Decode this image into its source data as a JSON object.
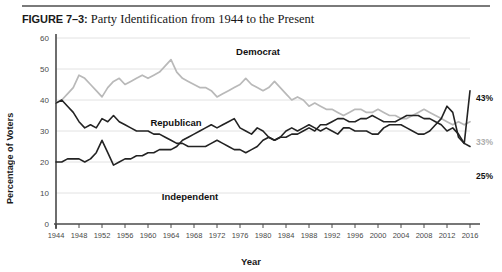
{
  "figure": {
    "number": "FIGURE 7–3:",
    "title": "Party Identification from 1944 to the Present"
  },
  "axis_title_y": "Percentage of Voters",
  "axis_title_x": "Year",
  "chart_data": {
    "type": "line",
    "title": "Party Identification from 1944 to the Present",
    "xlabel": "Year",
    "ylabel": "Percentage of Voters",
    "xlim": [
      1944,
      2016
    ],
    "ylim": [
      0,
      60
    ],
    "ytick_labels": [
      "0",
      "10",
      "20",
      "30",
      "40",
      "50",
      "60"
    ],
    "yticks": [
      0,
      10,
      20,
      30,
      40,
      50,
      60
    ],
    "xtick_labels": [
      "1944",
      "1948",
      "1952",
      "1956",
      "1960",
      "1964",
      "1968",
      "1972",
      "1976",
      "1980",
      "1984",
      "1988",
      "1992",
      "1996",
      "2000",
      "2004",
      "2008",
      "2012",
      "2016"
    ],
    "xticks": [
      1944,
      1948,
      1952,
      1956,
      1960,
      1964,
      1968,
      1972,
      1976,
      1980,
      1984,
      1988,
      1992,
      1996,
      2000,
      2004,
      2008,
      2012,
      2016
    ],
    "grid": "horizontal",
    "legend": "inline-labels",
    "colors": {
      "democrat": "#b9b9b9",
      "republican": "#232323",
      "independent": "#232323",
      "gridline": "#e2e2e2",
      "axis": "#4a4a4a"
    },
    "series": [
      {
        "name": "Democrat",
        "color": "#b9b9b9",
        "end_label": "33%",
        "x": [
          1944,
          1945,
          1946,
          1947,
          1948,
          1949,
          1950,
          1951,
          1952,
          1953,
          1954,
          1955,
          1956,
          1957,
          1958,
          1959,
          1960,
          1961,
          1962,
          1963,
          1964,
          1965,
          1966,
          1967,
          1968,
          1969,
          1970,
          1971,
          1972,
          1973,
          1974,
          1975,
          1976,
          1977,
          1978,
          1979,
          1980,
          1981,
          1982,
          1983,
          1984,
          1985,
          1986,
          1987,
          1988,
          1989,
          1990,
          1991,
          1992,
          1993,
          1994,
          1995,
          1996,
          1997,
          1998,
          1999,
          2000,
          2001,
          2002,
          2003,
          2004,
          2005,
          2006,
          2007,
          2008,
          2009,
          2010,
          2011,
          2012,
          2013,
          2014,
          2015,
          2016
        ],
        "values": [
          39,
          40,
          42,
          44,
          48,
          47,
          45,
          43,
          41,
          44,
          46,
          47,
          45,
          46,
          47,
          48,
          47,
          48,
          49,
          51,
          53,
          49,
          47,
          46,
          45,
          44,
          44,
          43,
          41,
          42,
          43,
          44,
          45,
          47,
          45,
          44,
          43,
          44,
          46,
          44,
          42,
          40,
          41,
          40,
          38,
          39,
          38,
          37,
          37,
          36,
          35,
          36,
          37,
          37,
          36,
          36,
          37,
          36,
          35,
          35,
          34,
          34,
          35,
          36,
          37,
          36,
          35,
          34,
          33,
          32,
          33,
          32,
          33
        ]
      },
      {
        "name": "Republican",
        "color": "#232323",
        "end_label": "43%",
        "x": [
          1944,
          1945,
          1946,
          1947,
          1948,
          1949,
          1950,
          1951,
          1952,
          1953,
          1954,
          1955,
          1956,
          1957,
          1958,
          1959,
          1960,
          1961,
          1962,
          1963,
          1964,
          1965,
          1966,
          1967,
          1968,
          1969,
          1970,
          1971,
          1972,
          1973,
          1974,
          1975,
          1976,
          1977,
          1978,
          1979,
          1980,
          1981,
          1982,
          1983,
          1984,
          1985,
          1986,
          1987,
          1988,
          1989,
          1990,
          1991,
          1992,
          1993,
          1994,
          1995,
          1996,
          1997,
          1998,
          1999,
          2000,
          2001,
          2002,
          2003,
          2004,
          2005,
          2006,
          2007,
          2008,
          2009,
          2010,
          2011,
          2012,
          2013,
          2014,
          2015,
          2016
        ],
        "values": [
          39,
          40,
          38,
          36,
          33,
          31,
          32,
          31,
          34,
          33,
          35,
          33,
          32,
          31,
          30,
          30,
          30,
          29,
          29,
          28,
          27,
          26,
          26,
          25,
          25,
          25,
          25,
          26,
          27,
          26,
          25,
          24,
          24,
          23,
          24,
          25,
          27,
          28,
          27,
          28,
          30,
          31,
          30,
          31,
          32,
          31,
          30,
          31,
          30,
          29,
          31,
          31,
          30,
          30,
          30,
          29,
          29,
          31,
          32,
          32,
          32,
          31,
          30,
          29,
          29,
          30,
          32,
          34,
          38,
          36,
          28,
          26,
          43
        ]
      },
      {
        "name": "Independent",
        "color": "#232323",
        "end_label": "25%",
        "x": [
          1944,
          1945,
          1946,
          1947,
          1948,
          1949,
          1950,
          1951,
          1952,
          1953,
          1954,
          1955,
          1956,
          1957,
          1958,
          1959,
          1960,
          1961,
          1962,
          1963,
          1964,
          1965,
          1966,
          1967,
          1968,
          1969,
          1970,
          1971,
          1972,
          1973,
          1974,
          1975,
          1976,
          1977,
          1978,
          1979,
          1980,
          1981,
          1982,
          1983,
          1984,
          1985,
          1986,
          1987,
          1988,
          1989,
          1990,
          1991,
          1992,
          1993,
          1994,
          1995,
          1996,
          1997,
          1998,
          1999,
          2000,
          2001,
          2002,
          2003,
          2004,
          2005,
          2006,
          2007,
          2008,
          2009,
          2010,
          2011,
          2012,
          2013,
          2014,
          2015,
          2016
        ],
        "values": [
          20,
          20,
          21,
          21,
          21,
          20,
          21,
          23,
          27,
          23,
          19,
          20,
          21,
          21,
          22,
          22,
          23,
          23,
          24,
          24,
          24,
          25,
          27,
          28,
          29,
          30,
          31,
          32,
          31,
          32,
          33,
          34,
          31,
          30,
          29,
          31,
          30,
          28,
          27,
          28,
          28,
          29,
          29,
          30,
          31,
          30,
          32,
          32,
          33,
          34,
          34,
          33,
          33,
          34,
          34,
          35,
          34,
          33,
          33,
          33,
          34,
          35,
          35,
          35,
          34,
          34,
          33,
          32,
          30,
          31,
          29,
          26,
          25
        ]
      }
    ],
    "annotations": [
      {
        "text": "Democrat",
        "series": "Democrat"
      },
      {
        "text": "Republican",
        "series": "Republican"
      },
      {
        "text": "Independent",
        "series": "Independent"
      },
      {
        "text": "43%",
        "series": "Republican"
      },
      {
        "text": "33%",
        "series": "Democrat"
      },
      {
        "text": "25%",
        "series": "Independent"
      }
    ]
  }
}
